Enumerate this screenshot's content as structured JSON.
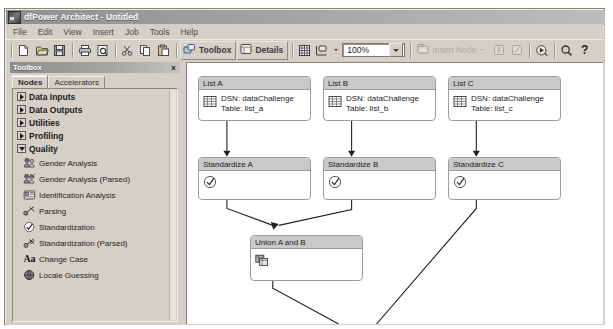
{
  "window": {
    "title": "dfPower Architect - Untitled",
    "app_icon": "app-icon"
  },
  "menu": {
    "items": [
      {
        "label": "File"
      },
      {
        "label": "Edit"
      },
      {
        "label": "View"
      },
      {
        "label": "Insert"
      },
      {
        "label": "Job"
      },
      {
        "label": "Tools"
      },
      {
        "label": "Help"
      }
    ]
  },
  "toolbar": {
    "new_tip": "New",
    "open_tip": "Open",
    "save_tip": "Save",
    "print_tip": "Print",
    "preview_tip": "Print Preview",
    "cut_tip": "Cut",
    "copy_tip": "Copy",
    "paste_tip": "Paste",
    "toolbox_label": "Toolbox",
    "details_label": "Details",
    "grid_tip": "Grid",
    "layout_tip": "Layout",
    "zoom_value": "100%",
    "insert_node_label": "Insert Node",
    "run_tip": "Run Job",
    "find_tip": "Find",
    "help_label": "?"
  },
  "toolbox": {
    "caption": "Toolbox",
    "close_label": "x",
    "tabs": [
      {
        "label": "Nodes",
        "active": true
      },
      {
        "label": "Accelerators",
        "active": false
      }
    ],
    "categories": [
      {
        "label": "Data Inputs",
        "expanded": false
      },
      {
        "label": "Data Outputs",
        "expanded": false
      },
      {
        "label": "Utilities",
        "expanded": false
      },
      {
        "label": "Profiling",
        "expanded": false
      },
      {
        "label": "Quality",
        "expanded": true
      }
    ],
    "quality_items": [
      {
        "label": "Gender Analysis",
        "icon": "gender-analysis-icon"
      },
      {
        "label": "Gender Analysis (Parsed)",
        "icon": "gender-analysis-parsed-icon"
      },
      {
        "label": "Identification Analysis",
        "icon": "identification-analysis-icon"
      },
      {
        "label": "Parsing",
        "icon": "parsing-icon"
      },
      {
        "label": "Standardization",
        "icon": "standardization-icon"
      },
      {
        "label": "Standardization (Parsed)",
        "icon": "standardization-parsed-icon"
      },
      {
        "label": "Change Case",
        "icon": "change-case-icon"
      },
      {
        "label": "Locale Guessing",
        "icon": "locale-guessing-icon"
      }
    ]
  },
  "canvas": {
    "nodes": [
      {
        "id": "list-a",
        "title": "List A",
        "icon": "table-icon",
        "line1": "DSN: dataChallenge",
        "line2": "Table: list_a"
      },
      {
        "id": "list-b",
        "title": "List B",
        "icon": "table-icon",
        "line1": "DSN: dataChallenge",
        "line2": "Table: list_b"
      },
      {
        "id": "list-c",
        "title": "List C",
        "icon": "table-icon",
        "line1": "DSN: dataChallenge",
        "line2": "Table: list_c"
      },
      {
        "id": "standardize-a",
        "title": "Standardize A",
        "icon": "standardization-icon",
        "line1": "",
        "line2": ""
      },
      {
        "id": "standardize-b",
        "title": "Standardize B",
        "icon": "standardization-icon",
        "line1": "",
        "line2": ""
      },
      {
        "id": "standardize-c",
        "title": "Standardize C",
        "icon": "standardization-icon",
        "line1": "",
        "line2": ""
      },
      {
        "id": "union-a-b",
        "title": "Union A and B",
        "icon": "union-icon",
        "line1": "",
        "line2": ""
      }
    ]
  },
  "colors": {
    "chrome": "#d4d0c8",
    "node_header": "#c9c9c9",
    "node_border": "#9d9d9d",
    "canvas": "#ffffff",
    "title_bar": "#a8a8a6"
  }
}
